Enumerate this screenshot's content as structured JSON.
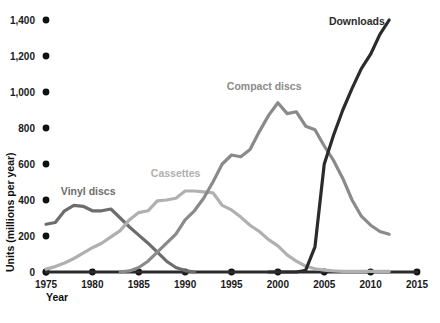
{
  "chart_data": {
    "type": "line",
    "title": "",
    "xlabel": "Year",
    "ylabel": "Units (millions per year)",
    "xlim": [
      1975,
      2015
    ],
    "ylim": [
      0,
      1400
    ],
    "grid": false,
    "legend_position": "inline-labels",
    "x_ticks": [
      "1975",
      "1980",
      "1985",
      "1990",
      "1995",
      "2000",
      "2005",
      "2010",
      "2015"
    ],
    "y_ticks": [
      "0",
      "200",
      "400",
      "600",
      "800",
      "1,000",
      "1,200",
      "1,400"
    ],
    "colors": {
      "vinyl": "#6d6d6d",
      "cassettes": "#b0b0b0",
      "compact_discs": "#8a8a8a",
      "downloads": "#2b2b2b",
      "axis": "#2b2b2b",
      "text": "#111111"
    },
    "series": [
      {
        "name": "Vinyl discs",
        "color": "#6d6d6d",
        "label_x": 1976.6,
        "label_y": 430,
        "x": [
          1975,
          1976,
          1977,
          1978,
          1979,
          1980,
          1981,
          1982,
          1983,
          1984,
          1985,
          1986,
          1987,
          1988,
          1989,
          1990,
          1991
        ],
        "values": [
          265,
          275,
          340,
          370,
          365,
          340,
          340,
          350,
          300,
          250,
          205,
          160,
          110,
          60,
          25,
          8,
          0
        ]
      },
      {
        "name": "Cassettes",
        "color": "#b0b0b0",
        "label_x": 1986.3,
        "label_y": 530,
        "x": [
          1975,
          1976,
          1977,
          1978,
          1979,
          1980,
          1981,
          1982,
          1983,
          1984,
          1985,
          1986,
          1987,
          1988,
          1989,
          1990,
          1991,
          1992,
          1993,
          1994,
          1995,
          1996,
          1997,
          1998,
          1999,
          2000,
          2001,
          2002,
          2003,
          2004,
          2005,
          2006,
          2007,
          2008,
          2009,
          2010,
          2011,
          2012
        ],
        "values": [
          16,
          30,
          50,
          75,
          105,
          135,
          160,
          195,
          230,
          290,
          330,
          340,
          395,
          400,
          410,
          450,
          450,
          445,
          440,
          370,
          345,
          305,
          260,
          225,
          180,
          145,
          95,
          60,
          32,
          18,
          10,
          6,
          4,
          3,
          3,
          3,
          3,
          3
        ]
      },
      {
        "name": "Compact discs",
        "color": "#8a8a8a",
        "label_x": 1994.5,
        "label_y": 1010,
        "x": [
          1983,
          1984,
          1985,
          1986,
          1987,
          1988,
          1989,
          1990,
          1991,
          1992,
          1993,
          1994,
          1995,
          1996,
          1997,
          1998,
          1999,
          2000,
          2001,
          2002,
          2003,
          2004,
          2005,
          2006,
          2007,
          2008,
          2009,
          2010,
          2011,
          2012
        ],
        "values": [
          0,
          6,
          25,
          60,
          110,
          160,
          210,
          290,
          340,
          410,
          500,
          600,
          650,
          640,
          680,
          780,
          870,
          940,
          880,
          890,
          810,
          790,
          700,
          620,
          520,
          400,
          310,
          260,
          225,
          210
        ]
      },
      {
        "name": "Downloads",
        "color": "#2b2b2b",
        "label_x": 2005.5,
        "label_y": 1375,
        "x": [
          1999,
          2000,
          2001,
          2002,
          2003,
          2004,
          2005,
          2006,
          2007,
          2008,
          2009,
          2010,
          2011,
          2012
        ],
        "values": [
          0,
          0,
          0,
          0,
          10,
          140,
          600,
          760,
          900,
          1020,
          1130,
          1210,
          1320,
          1400
        ]
      }
    ]
  }
}
